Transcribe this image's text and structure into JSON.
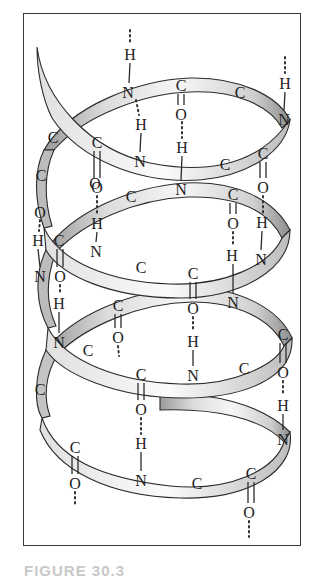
{
  "figure": {
    "caption": "FIGURE 30.3",
    "colors": {
      "ribbon_light": "#f4f4f4",
      "ribbon_dark": "#a9a9a9",
      "outline": "#2b2b2b",
      "frame": "#3a3a3a",
      "caption": "#c8c8c8"
    }
  },
  "atoms": [
    {
      "id": "a1",
      "label": "H",
      "x": 130,
      "y": 54
    },
    {
      "id": "a2",
      "label": "N",
      "x": 128,
      "y": 92
    },
    {
      "id": "a3",
      "label": "C",
      "x": 181,
      "y": 85
    },
    {
      "id": "a4",
      "label": "O",
      "x": 181,
      "y": 114
    },
    {
      "id": "a5",
      "label": "C",
      "x": 240,
      "y": 92
    },
    {
      "id": "a6",
      "label": "H",
      "x": 285,
      "y": 83
    },
    {
      "id": "a7",
      "label": "N",
      "x": 284,
      "y": 119
    },
    {
      "id": "a8",
      "label": "H",
      "x": 141,
      "y": 124
    },
    {
      "id": "a9",
      "label": "C",
      "x": 53,
      "y": 137
    },
    {
      "id": "a10",
      "label": "C",
      "x": 97,
      "y": 142
    },
    {
      "id": "a11",
      "label": "H",
      "x": 182,
      "y": 147
    },
    {
      "id": "a12",
      "label": "N",
      "x": 140,
      "y": 161
    },
    {
      "id": "a13",
      "label": "C",
      "x": 225,
      "y": 164
    },
    {
      "id": "a14",
      "label": "C",
      "x": 263,
      "y": 153
    },
    {
      "id": "a15",
      "label": "C",
      "x": 41,
      "y": 175
    },
    {
      "id": "a16",
      "label": "O",
      "x": 97,
      "y": 187
    },
    {
      "id": "a17",
      "label": "N",
      "x": 181,
      "y": 189
    },
    {
      "id": "a18",
      "label": "O",
      "x": 263,
      "y": 187
    },
    {
      "id": "a19",
      "label": "C",
      "x": 131,
      "y": 196
    },
    {
      "id": "a20",
      "label": "C",
      "x": 233,
      "y": 194
    },
    {
      "id": "a21",
      "label": "O",
      "x": 40,
      "y": 212
    },
    {
      "id": "a22",
      "label": "O",
      "x": 95,
      "y": 183
    },
    {
      "id": "a23",
      "label": "O",
      "x": 233,
      "y": 223
    },
    {
      "id": "a24",
      "label": "H",
      "x": 262,
      "y": 222
    },
    {
      "id": "a25",
      "label": "H",
      "x": 97,
      "y": 223
    },
    {
      "id": "a26",
      "label": "H",
      "x": 38,
      "y": 240
    },
    {
      "id": "a27",
      "label": "C",
      "x": 59,
      "y": 240
    },
    {
      "id": "a28",
      "label": "N",
      "x": 96,
      "y": 251
    },
    {
      "id": "a29",
      "label": "H",
      "x": 232,
      "y": 255
    },
    {
      "id": "a30",
      "label": "N",
      "x": 261,
      "y": 259
    },
    {
      "id": "a31",
      "label": "N",
      "x": 40,
      "y": 276
    },
    {
      "id": "a32",
      "label": "O",
      "x": 60,
      "y": 276
    },
    {
      "id": "a33",
      "label": "C",
      "x": 141,
      "y": 267
    },
    {
      "id": "a34",
      "label": "C",
      "x": 193,
      "y": 273
    },
    {
      "id": "a35",
      "label": "N",
      "x": 233,
      "y": 302
    },
    {
      "id": "a36",
      "label": "H",
      "x": 59,
      "y": 303
    },
    {
      "id": "a37",
      "label": "C",
      "x": 118,
      "y": 305
    },
    {
      "id": "a38",
      "label": "O",
      "x": 193,
      "y": 308
    },
    {
      "id": "a39",
      "label": "O",
      "x": 118,
      "y": 337
    },
    {
      "id": "a40",
      "label": "H",
      "x": 193,
      "y": 341
    },
    {
      "id": "a41",
      "label": "C",
      "x": 283,
      "y": 334
    },
    {
      "id": "a42",
      "label": "N",
      "x": 59,
      "y": 342
    },
    {
      "id": "a43",
      "label": "C",
      "x": 88,
      "y": 350
    },
    {
      "id": "a44",
      "label": "C",
      "x": 141,
      "y": 374
    },
    {
      "id": "a45",
      "label": "N",
      "x": 193,
      "y": 375
    },
    {
      "id": "a46",
      "label": "C",
      "x": 244,
      "y": 368
    },
    {
      "id": "a47",
      "label": "O",
      "x": 283,
      "y": 372
    },
    {
      "id": "a48",
      "label": "C",
      "x": 40,
      "y": 389
    },
    {
      "id": "a49",
      "label": "O",
      "x": 141,
      "y": 409
    },
    {
      "id": "a50",
      "label": "H",
      "x": 283,
      "y": 405
    },
    {
      "id": "a51",
      "label": "H",
      "x": 141,
      "y": 443
    },
    {
      "id": "a52",
      "label": "N",
      "x": 283,
      "y": 439
    },
    {
      "id": "a53",
      "label": "C",
      "x": 75,
      "y": 447
    },
    {
      "id": "a54",
      "label": "O",
      "x": 75,
      "y": 483
    },
    {
      "id": "a55",
      "label": "N",
      "x": 141,
      "y": 480
    },
    {
      "id": "a56",
      "label": "C",
      "x": 197,
      "y": 483
    },
    {
      "id": "a57",
      "label": "C",
      "x": 251,
      "y": 473
    },
    {
      "id": "a58",
      "label": "O",
      "x": 249,
      "y": 512
    }
  ]
}
